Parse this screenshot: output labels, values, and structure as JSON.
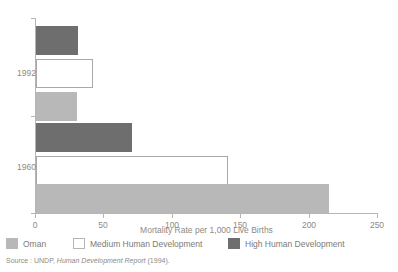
{
  "chart_data": {
    "type": "bar",
    "orientation": "horizontal",
    "title": "",
    "xlabel": "Mortality Rate per 1,000 Live Births",
    "ylabel": "",
    "categories": [
      "1992",
      "1960"
    ],
    "xlim": [
      0,
      250
    ],
    "xticks": [
      0,
      50,
      100,
      150,
      200,
      250
    ],
    "xtick_labels": [
      "0",
      "50",
      "100",
      "150",
      "200",
      "250"
    ],
    "grid": false,
    "legend_position": "bottom-left",
    "series": [
      {
        "name": "High Human Development",
        "color": "#6e6e6e",
        "values": [
          31,
          70
        ]
      },
      {
        "name": "Medium Human Development",
        "color": "#ffffff",
        "values": [
          42,
          140
        ]
      },
      {
        "name": "Oman",
        "color": "#b8b8b8",
        "values": [
          30,
          214
        ]
      }
    ],
    "series_order_top_to_bottom": [
      "High Human Development",
      "Medium Human Development",
      "Oman"
    ]
  },
  "legend": {
    "entries": [
      {
        "label": "Oman",
        "swatch": "oman"
      },
      {
        "label": "Medium Human Development",
        "swatch": "medium"
      },
      {
        "label": "High Human Development",
        "swatch": "high"
      }
    ]
  },
  "source": {
    "prefix": "Source : UNDP,",
    "publication": "Human Development Report",
    "suffix": "(1994)."
  }
}
